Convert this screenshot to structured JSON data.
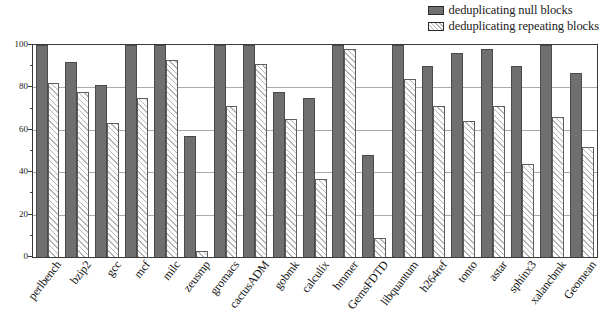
{
  "chart_data": {
    "type": "bar",
    "title": "",
    "subtitle": "",
    "xlabel": "",
    "ylabel": "",
    "ylim": [
      0,
      100
    ],
    "yticks": [
      0,
      20,
      40,
      60,
      80,
      100
    ],
    "ytick_labels": [
      "0",
      "20",
      "40",
      "60",
      "80",
      "100"
    ],
    "minor_yticks": [
      10,
      30,
      50,
      70,
      90
    ],
    "grid": true,
    "grid_axis": "y",
    "legend_position": "top-right",
    "categories": [
      "perlbench",
      "bzip2",
      "gcc",
      "mcf",
      "milc",
      "zeusmp",
      "gromacs",
      "cactusADM",
      "gobmk",
      "calculix",
      "hmmer",
      "GemsFDTD",
      "libquantum",
      "h264ref",
      "tonto",
      "astar",
      "sphinx3",
      "xalancbmk",
      "Geomean"
    ],
    "series": [
      {
        "name": "deduplicating null blocks",
        "color": "#6f6f6f",
        "fill": "solid",
        "values": [
          100,
          92,
          81,
          100,
          100,
          57,
          100,
          100,
          78,
          75,
          100,
          48,
          100,
          90,
          96,
          98,
          90,
          100,
          87
        ]
      },
      {
        "name": "deduplicating repeating blocks",
        "color": "#fcfcfc",
        "fill": "diagonal-hatch",
        "values": [
          82,
          78,
          63,
          75,
          93,
          3,
          71,
          91,
          65,
          37,
          98,
          9,
          84,
          71,
          64,
          71,
          44,
          66,
          52
        ]
      }
    ]
  },
  "legend": {
    "items": [
      {
        "label": "deduplicating null blocks",
        "swatch": "solid-dark-swatch"
      },
      {
        "label": "deduplicating repeating blocks",
        "swatch": "hatched-light-swatch"
      }
    ]
  }
}
